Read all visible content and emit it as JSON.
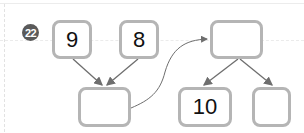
{
  "problem": {
    "number": "22",
    "badge_color": "#5a5a5a"
  },
  "diagram": {
    "step1": {
      "inputs": [
        "9",
        "8"
      ],
      "result": ""
    },
    "step2": {
      "total": "",
      "parts": [
        "10",
        ""
      ]
    },
    "box_border_color": "#b5b5b5",
    "arrow_color": "#6e6e6e"
  }
}
